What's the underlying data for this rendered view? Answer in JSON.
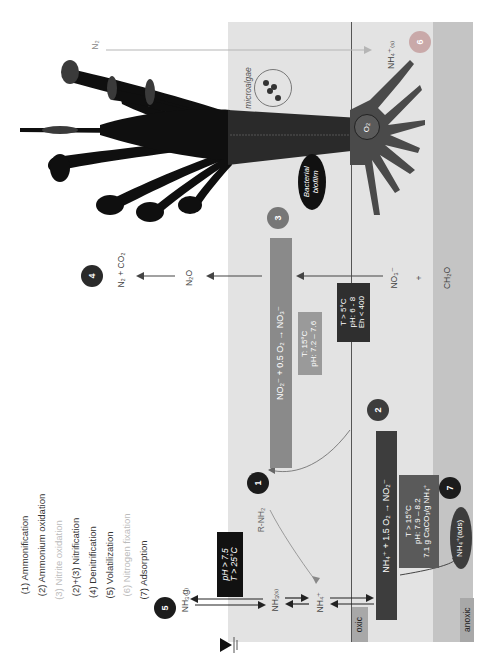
{
  "legend": {
    "items": [
      {
        "label": "(1) Ammonification",
        "faded": false
      },
      {
        "label": "(2) Ammonium oxidation",
        "faded": false
      },
      {
        "label": "(3) Nitrite oxidation",
        "faded": true
      },
      {
        "label": "(2)+(3) Nitrification",
        "faded": false
      },
      {
        "label": "(4) Denitrification",
        "faded": false
      },
      {
        "label": "(5) Volatilization",
        "faded": false
      },
      {
        "label": "(6) Nitrogen fixation",
        "faded": true
      },
      {
        "label": "(7) Adsorption",
        "faded": false
      }
    ]
  },
  "zones": {
    "oxic_label": "oxic",
    "anoxic_label": "anoxic"
  },
  "markers": {
    "m1": "1",
    "m2": "2",
    "m3": "3",
    "m4": "4",
    "m5": "5",
    "m6": "6",
    "m7": "7"
  },
  "species": {
    "n2": "N₂",
    "nh4_s": "NH₄⁺₍ₛ₎",
    "microalgae": "microalgae",
    "o2": "O₂",
    "biofilm_line1": "Bacterial",
    "biofilm_line2": "biofilm",
    "n2_co2": "N₂ + CO₂",
    "n2o": "N₂O",
    "no3": "NO₃⁻",
    "plus": "+",
    "ch2o": "CH₂O",
    "r_nh2": "R-NH₂",
    "nh3_g": "NH₃₍g₎",
    "nh3_s": "NH₃₍ₛ₎",
    "nh4": "NH₄⁺",
    "nh4_ads": "NH₄⁺(ads)"
  },
  "reactions": {
    "nitrite_oxidation": "NO₂⁻ + 0.5 O₂  →  NO₃⁻",
    "ammonium_oxidation": "NH₄⁺ + 1.5 O₂  →  NO₂⁻"
  },
  "conditions": {
    "nitrite_ox": [
      "T: 15°C",
      "pH: 7.2 – 7.6"
    ],
    "denitrification": [
      "T > 5°C",
      "pH: 6 - 8",
      "Eh < 400"
    ],
    "ammonium_ox": [
      "T > 15°C",
      "pH: 7.9 – 8.2",
      "7.1 g CaCO₃/g NH₄⁺"
    ],
    "volatilization": [
      "pH > 7.5",
      "T > 25°C"
    ]
  },
  "colors": {
    "panel_light": "#e3e3e3",
    "panel_dark": "#c4c4c4",
    "box_dark": "#3d3d3d",
    "box_mid": "#8a8a8a",
    "marker_dark": "#1c1c1c",
    "marker_mid": "#777777",
    "marker_light": "#c9a9a9",
    "plant": "#0f0f0f",
    "root": "#4a4a4a"
  }
}
